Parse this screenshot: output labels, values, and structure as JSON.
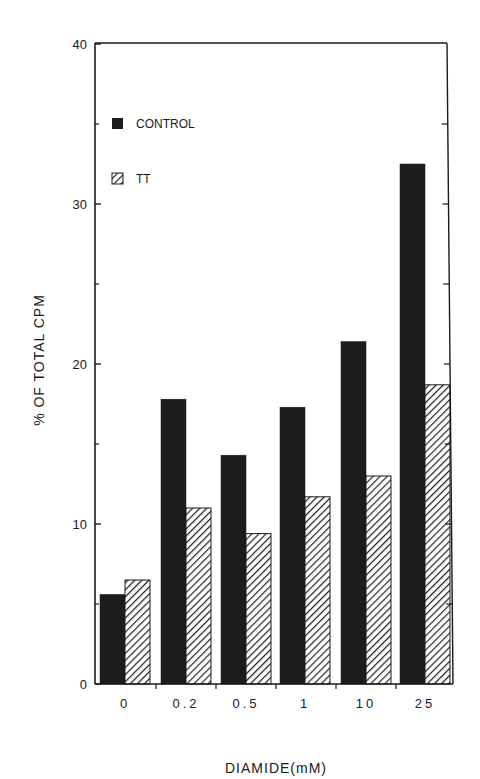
{
  "chart_data": {
    "type": "bar",
    "title": "",
    "xlabel": "DIAMIDE(mM)",
    "ylabel": "% OF TOTAL CPM",
    "categories": [
      "0",
      "0.2",
      "0.5",
      "1",
      "10",
      "25"
    ],
    "category_labels_display": [
      "0",
      "0.2",
      "0.5",
      "1",
      "10",
      "25"
    ],
    "series": [
      {
        "name": "CONTROL",
        "fill": "solid",
        "color": "#1c1c1c",
        "values": [
          5.6,
          17.8,
          14.3,
          17.3,
          21.4,
          32.5
        ]
      },
      {
        "name": "TT",
        "fill": "hatched",
        "color": "#2a2a2a",
        "values": [
          6.5,
          11.0,
          9.4,
          11.7,
          13.0,
          18.7
        ]
      }
    ],
    "ylim": [
      0,
      40
    ],
    "yticks": [
      0,
      10,
      20,
      30,
      40
    ],
    "minor_yticks": [
      5,
      15,
      25,
      35
    ],
    "grid": false,
    "legend_position": "upper-left inside"
  },
  "legend": [
    {
      "label": "CONTROL"
    },
    {
      "label": "TT"
    }
  ],
  "axes": {
    "y_title": "% OF TOTAL CPM",
    "x_title": "DIAMIDE(mM)",
    "y_ticks": [
      "0",
      "10",
      "20",
      "30",
      "40"
    ],
    "x_ticks": [
      "0",
      "0.2",
      "0.5",
      "1",
      "10",
      "25"
    ]
  }
}
